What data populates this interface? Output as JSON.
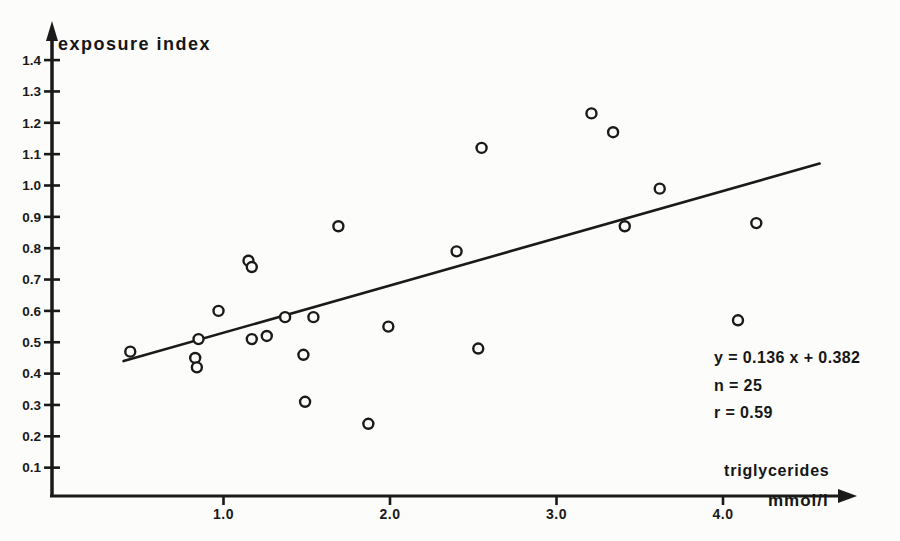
{
  "figure": {
    "background": "#fcfcfb",
    "ink_color": "#1a1a1a"
  },
  "chart_data": {
    "type": "scatter",
    "title": "exposure index",
    "ylabel": "exposure index",
    "xlabel": "triglycerides",
    "xunit": "mmol/l",
    "xlim": [
      0,
      4.8
    ],
    "ylim": [
      0,
      1.5
    ],
    "grid": false,
    "x_ticks": [
      {
        "value": 1.0,
        "label": "1.0"
      },
      {
        "value": 2.0,
        "label": "2.0"
      },
      {
        "value": 3.0,
        "label": "3.0"
      },
      {
        "value": 4.0,
        "label": "4.0"
      }
    ],
    "y_ticks": [
      {
        "value": 0.1,
        "label": "0.1"
      },
      {
        "value": 0.2,
        "label": "0.2"
      },
      {
        "value": 0.3,
        "label": "0.3"
      },
      {
        "value": 0.4,
        "label": "0.4"
      },
      {
        "value": 0.5,
        "label": "0.5"
      },
      {
        "value": 0.6,
        "label": "0.6"
      },
      {
        "value": 0.7,
        "label": "0.7"
      },
      {
        "value": 0.8,
        "label": "0.8"
      },
      {
        "value": 0.9,
        "label": "0.9"
      },
      {
        "value": 1.0,
        "label": "1.0"
      },
      {
        "value": 1.1,
        "label": "1.1"
      },
      {
        "value": 1.2,
        "label": "1.2"
      },
      {
        "value": 1.3,
        "label": "1.3"
      },
      {
        "value": 1.4,
        "label": "1.4"
      }
    ],
    "points": [
      {
        "x": 0.44,
        "y": 0.47
      },
      {
        "x": 0.83,
        "y": 0.45
      },
      {
        "x": 0.84,
        "y": 0.42
      },
      {
        "x": 0.85,
        "y": 0.51
      },
      {
        "x": 0.97,
        "y": 0.6
      },
      {
        "x": 1.15,
        "y": 0.76
      },
      {
        "x": 1.17,
        "y": 0.74
      },
      {
        "x": 1.17,
        "y": 0.51
      },
      {
        "x": 1.26,
        "y": 0.52
      },
      {
        "x": 1.37,
        "y": 0.58
      },
      {
        "x": 1.48,
        "y": 0.46
      },
      {
        "x": 1.49,
        "y": 0.31
      },
      {
        "x": 1.54,
        "y": 0.58
      },
      {
        "x": 1.69,
        "y": 0.87
      },
      {
        "x": 1.87,
        "y": 0.24
      },
      {
        "x": 1.99,
        "y": 0.55
      },
      {
        "x": 2.4,
        "y": 0.79
      },
      {
        "x": 2.53,
        "y": 0.48
      },
      {
        "x": 2.55,
        "y": 1.12
      },
      {
        "x": 3.21,
        "y": 1.23
      },
      {
        "x": 3.34,
        "y": 1.17
      },
      {
        "x": 3.41,
        "y": 0.87
      },
      {
        "x": 3.62,
        "y": 0.99
      },
      {
        "x": 4.09,
        "y": 0.57
      },
      {
        "x": 4.2,
        "y": 0.88
      }
    ],
    "regression_line": {
      "equation": "y = 0.136 x + 0.382",
      "slope": 0.136,
      "intercept": 0.382,
      "n": 25,
      "r": 0.59,
      "drawn_x1": 0.4,
      "drawn_y1": 0.44,
      "drawn_x2": 4.58,
      "drawn_y2": 1.07
    },
    "annotation": [
      "y = 0.136 x + 0.382",
      "n = 25",
      "r = 0.59"
    ]
  }
}
